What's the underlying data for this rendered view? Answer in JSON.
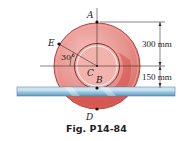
{
  "figure": {
    "caption": "Fig. P14-84",
    "points": {
      "A": "A",
      "B": "B",
      "C": "C",
      "D": "D",
      "E": "E"
    },
    "angle_label": "30°",
    "dimensions": {
      "upper": "300 mm",
      "lower": "150 mm"
    },
    "colors": {
      "disk_outer": "#e58b87",
      "disk_rim": "#c94a45",
      "disk_shadow": "#d0504a",
      "hub": "#f3b3ad",
      "rail_top": "#b9d9ea",
      "rail_bottom": "#6fa6c8",
      "line": "#333333"
    }
  }
}
